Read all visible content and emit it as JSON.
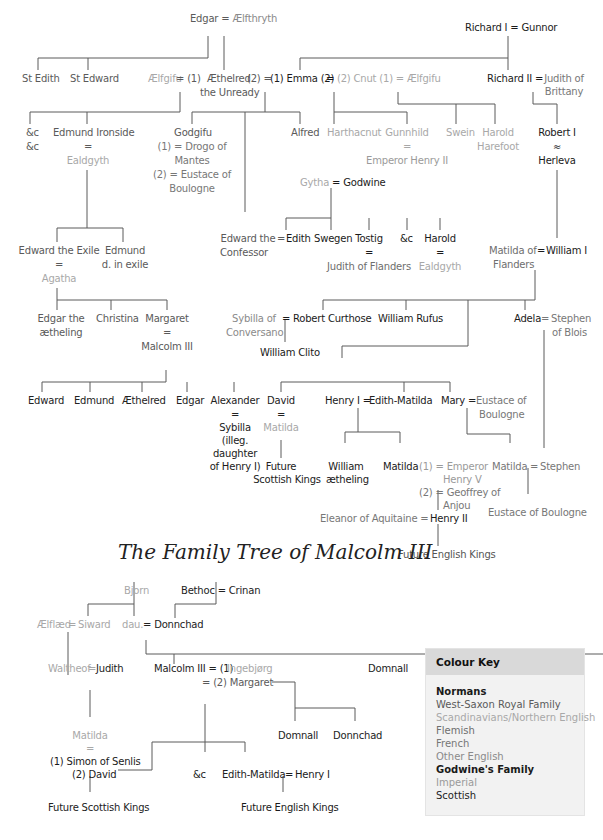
{
  "diagram": {
    "upper_tree": {
      "edgar_couple": {
        "left": "Edgar",
        "eq": "=",
        "right": "Ælfthryth"
      },
      "richard_couple": {
        "left": "Richard I",
        "eq": "=",
        "right": "Gunnor"
      },
      "st_edith": "St Edith",
      "st_edward": "St Edward",
      "aelfgifu": "Ælfgifu",
      "aelfgifu_eq": "= (1)",
      "aethelred": "Æthelred",
      "aethelred_eq2": "(2) =",
      "aethelred_epithet": "the Unready",
      "emma": "(1) Emma (2)",
      "emma_eq": "=",
      "cnut": "(2) Cnut (1) = Ælfgifu",
      "richard_ii": "Richard II =",
      "judith_brittany": "Judith of\nBrittany",
      "etc1": "&c",
      "etc2": "&c",
      "edmund_ironside": "Edmund Ironside",
      "ironside_eq": "=",
      "ealdgyth1": "Ealdgyth",
      "godgifu": "Godgifu",
      "godgifu_m1": "(1) = Drogo of",
      "godgifu_m1b": "Mantes",
      "godgifu_m2": "(2) = Eustace of",
      "godgifu_m2b": "Boulogne",
      "alfred": "Alfred",
      "harthacnut": "Harthacnut",
      "gunnhild": "Gunnhild",
      "gunnhild_eq": "=",
      "emperor_henry_ii": "Emperor Henry II",
      "swein": "Swein",
      "harold_harefoot": "Harold",
      "harold_harefoot2": "Harefoot",
      "robert_i": "Robert I",
      "robert_eq": "≈",
      "herleva": "Herleva",
      "gytha_couple": {
        "left": "Gytha",
        "eq": "=",
        "right": "Godwine"
      },
      "edward_exile": "Edward the Exile",
      "exile_eq": "=",
      "agatha": "Agatha",
      "edmund_exile": "Edmund",
      "edmund_exile2": "d. in exile",
      "edward_confessor": "Edward the",
      "edward_confessor2": "Confessor",
      "confessor_eq": "=",
      "edith": "Edith",
      "swegen": "Swegen",
      "tostig": "Tostig",
      "tostig_eq": "=",
      "judith_flanders": "Judith of Flanders",
      "etc3": "&c",
      "harold": "Harold",
      "harold_eq": "=",
      "ealdgyth2": "Ealdgyth",
      "matilda_flanders": "Matilda of",
      "matilda_flanders2": "Flanders",
      "william_eq": "=",
      "william_i": "William I",
      "edgar_aetheling": "Edgar the",
      "edgar_aetheling2": "ætheling",
      "christina": "Christina",
      "margaret": "Margaret",
      "margaret_eq": "=",
      "malcolm_iii": "Malcolm III",
      "sybilla_conversano": "Sybilla of",
      "sybilla_conversano2": "Conversano",
      "curthose_eq": "=",
      "robert_curthose": "Robert Curthose",
      "william_rufus": "William Rufus",
      "william_clito": "William Clito",
      "adela": "Adela",
      "adela_eq": "=",
      "stephen_blois": "Stephen",
      "stephen_blois2": "of Blois",
      "children": [
        "Edward",
        "Edmund",
        "Æthelred",
        "Edgar",
        "Alexander",
        "David"
      ],
      "alexander_eq": "=",
      "sybilla": "Sybilla",
      "sybilla2": "(illeg.",
      "sybilla3": "daughter",
      "sybilla4": "of Henry I)",
      "david_eq": "=",
      "matilda_david": "Matilda",
      "future_scottish": "Future",
      "future_scottish2": "Scottish Kings",
      "henry_i": "Henry I =",
      "edith_matilda": "Edith-Matilda",
      "mary": "Mary =",
      "eustace_boulogne": "Eustace of",
      "eustace_boulogne2": "Boulogne",
      "william_aetheling": "William",
      "william_aetheling2": "ætheling",
      "matilda_empress": "Matilda",
      "matilda_m1": "(1) = Emperor",
      "matilda_m1b": "Henry V",
      "matilda_m2": "(2) = Geoffrey of",
      "matilda_m2b": "Anjou",
      "matilda_stephen": "Matilda",
      "stephen_eq": "=",
      "stephen": "Stephen",
      "eustace_son": "Eustace of Boulogne",
      "eleanor": "Eleanor of Aquitaine =",
      "henry_ii": "Henry II",
      "future_english": "Future English Kings"
    },
    "lower_tree": {
      "bjorn": "Bjorn",
      "bethoc_couple": "Bethoc = Crinan",
      "aelflaed": "Ælflæd",
      "siward_eq": "=",
      "siward": "Siward",
      "dau": "dau.",
      "donnchad_eq": "= Donnchad",
      "waltheof": "Waltheof",
      "waltheof_eq": "=",
      "judith": "Judith",
      "malcolm": "Malcolm III = (1)",
      "ingebjorg": "Ingebjørg",
      "margaret2": "= (2) Margaret",
      "domnall_top": "Domnall",
      "matilda": "Matilda",
      "matilda_eq": "=",
      "simon": "(1) Simon of Senlis",
      "david2": "(2) David",
      "domnall": "Domnall",
      "donnchad": "Donnchad",
      "etc": "&c",
      "edith_matilda": "Edith-Matilda",
      "henry_eq": "=",
      "henry_i": "Henry I",
      "future_scottish_kings": "Future Scottish Kings",
      "future_english_kings": "Future English Kings"
    },
    "colour_key": {
      "title": "Colour Key",
      "items": [
        {
          "label": "Normans",
          "color": "#1a1a1a"
        },
        {
          "label": "West-Saxon Royal Family",
          "color": "#5a5a5a"
        },
        {
          "label": "Scandinavians/Northern English",
          "color": "#a8a8a8"
        },
        {
          "label": "Flemish",
          "color": "#6e6e6e"
        },
        {
          "label": "French",
          "color": "#777777"
        },
        {
          "label": "Other English",
          "color": "#8a8a8a"
        },
        {
          "label": "Godwine's Family",
          "color": "#1a1a1a"
        },
        {
          "label": "Imperial",
          "color": "#9a9a9a"
        },
        {
          "label": "Scottish",
          "color": "#222222"
        }
      ]
    }
  }
}
